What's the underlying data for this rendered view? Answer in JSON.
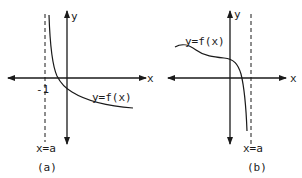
{
  "figure": {
    "panels": [
      {
        "id": "a",
        "caption": "(a)",
        "axes": {
          "x_label": "x",
          "y_label": "y"
        },
        "tick_label": "-1",
        "curve_label": "y=f(x)",
        "asymptote_label": "x=a",
        "description": "Vertical asymptote at x=a=-1 (dashed); curve decreasing from +infinity near the asymptote, crossing x-axis between -1 and 0, approaching a negative horizontal value as x increases."
      },
      {
        "id": "b",
        "caption": "(b)",
        "axes": {
          "x_label": "x",
          "y_label": "y"
        },
        "curve_label": "y=f(x)",
        "asymptote_label": "x=a",
        "description": "Vertical asymptote at x=a>0 (dashed); curve gently wavy and positive for negative x, then dropping steeply through the x-axis toward -infinity as x approaches a from the left."
      }
    ]
  }
}
